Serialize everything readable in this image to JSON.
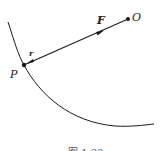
{
  "diagram": {
    "labels": {
      "origin": "O",
      "point": "P",
      "force": "F",
      "radius": "r"
    },
    "caption": "图 1-22",
    "colors": {
      "stroke": "#1a1a1a",
      "background": "#ffffff"
    }
  }
}
